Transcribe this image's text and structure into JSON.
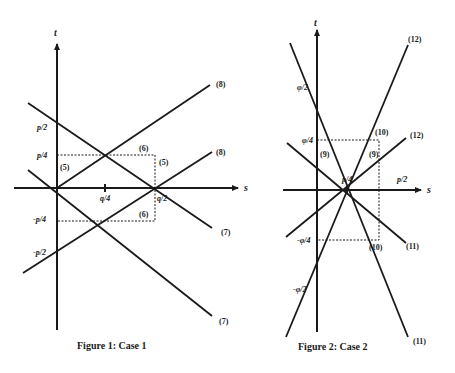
{
  "figures": [
    {
      "caption": "Figure 1: Case 1",
      "axes": {
        "x_label": "s",
        "y_label": "t"
      },
      "ticks": {
        "y": [
          "p/2",
          "p/4",
          "-p/4",
          "-p/2"
        ],
        "x": [
          "q/4",
          "q/2"
        ]
      },
      "line_labels": [
        "(8)",
        "(8)",
        "(7)",
        "(7)",
        "(6)",
        "(6)",
        "(5)",
        "(5)"
      ]
    },
    {
      "caption": "Figure 2: Case 2",
      "axes": {
        "x_label": "s",
        "y_label": "t"
      },
      "ticks": {
        "y": [
          "φ/2",
          "φ/4",
          "-φ/4",
          "-φ/2"
        ],
        "x": [
          "p/4",
          "p/2"
        ]
      },
      "line_labels": [
        "(12)",
        "(12)",
        "(11)",
        "(11)",
        "(10)",
        "(10)",
        "(9)",
        "(9)"
      ]
    }
  ]
}
